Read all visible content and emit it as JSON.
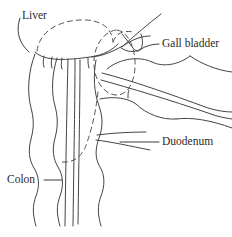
{
  "diagram": {
    "style": {
      "background_color": "#ffffff",
      "stroke_color": "#444444",
      "dashed_stroke_color": "#555555",
      "leader_color": "#3a3a3a",
      "text_color": "#2b2b2b"
    },
    "labels": [
      {
        "id": "liver",
        "text": "Liver",
        "x": 22,
        "y": 16,
        "anchor": "start"
      },
      {
        "id": "gall-bladder",
        "text": "Gall bladder",
        "x": 162,
        "y": 44,
        "anchor": "start"
      },
      {
        "id": "duodenum",
        "text": "Duodenum",
        "x": 162,
        "y": 142,
        "anchor": "start"
      },
      {
        "id": "colon",
        "text": "Colon",
        "x": 7,
        "y": 180,
        "anchor": "start"
      }
    ],
    "organs": [
      "liver",
      "gall-bladder",
      "duodenum",
      "colon"
    ]
  }
}
